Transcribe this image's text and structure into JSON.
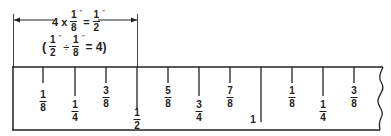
{
  "dimension": {
    "equation_top": {
      "multiplier": "4 x",
      "frac_a": {
        "num": "1",
        "den": "8",
        "unit": "\""
      },
      "equals": "=",
      "frac_b": {
        "num": "1",
        "den": "2",
        "unit": "\""
      }
    },
    "equation_bottom": {
      "open": "(",
      "frac_a": {
        "num": "1",
        "den": "2",
        "unit": "\""
      },
      "divide": "÷",
      "frac_b": {
        "num": "1",
        "den": "8",
        "unit": "\""
      },
      "result": "= 4)"
    }
  },
  "ruler": {
    "tick_spacing_px": 31,
    "labels": [
      {
        "num": "1",
        "den": "8"
      },
      {
        "num": "1",
        "den": "4"
      },
      {
        "num": "3",
        "den": "8"
      },
      {
        "num": "1",
        "den": "2"
      },
      {
        "num": "5",
        "den": "8"
      },
      {
        "num": "3",
        "den": "4"
      },
      {
        "num": "7",
        "den": "8"
      },
      {
        "whole": "1"
      },
      {
        "num": "1",
        "den": "8"
      },
      {
        "num": "1",
        "den": "4"
      },
      {
        "num": "3",
        "den": "8"
      }
    ]
  },
  "colors": {
    "line": "#222222",
    "background": "#ffffff"
  }
}
